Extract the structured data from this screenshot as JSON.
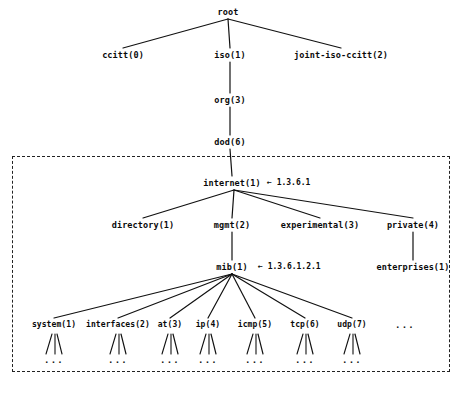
{
  "diagram": {
    "type": "tree",
    "width": 467,
    "height": 393,
    "line_color": "#111111",
    "text_color": "#0a0a0a",
    "background": "#ffffff"
  },
  "nodes": {
    "root": {
      "label": "root",
      "x": 228,
      "y": 12
    },
    "ccitt": {
      "label": "ccitt(0)",
      "x": 123,
      "y": 55
    },
    "iso": {
      "label": "iso(1)",
      "x": 230,
      "y": 55
    },
    "joint": {
      "label": "joint-iso-ccitt(2)",
      "x": 341,
      "y": 55
    },
    "org": {
      "label": "org(3)",
      "x": 230,
      "y": 100
    },
    "dod": {
      "label": "dod(6)",
      "x": 230,
      "y": 142
    },
    "internet": {
      "label": "internet(1)",
      "x": 232,
      "y": 183
    },
    "directory": {
      "label": "directory(1)",
      "x": 143,
      "y": 225
    },
    "mgmt": {
      "label": "mgmt(2)",
      "x": 232,
      "y": 225
    },
    "experimental": {
      "label": "experimental(3)",
      "x": 320,
      "y": 225
    },
    "private": {
      "label": "private(4)",
      "x": 413,
      "y": 225
    },
    "mib": {
      "label": "mib(1)",
      "x": 232,
      "y": 267
    },
    "enterprises": {
      "label": "enterprises(1)",
      "x": 413,
      "y": 267
    }
  },
  "annotations": [
    {
      "name": "internet-oid",
      "text": "← 1.3.6.1",
      "x": 267,
      "y": 183
    },
    {
      "name": "mib-oid",
      "text": "← 1.3.6.1.2.1",
      "x": 258,
      "y": 267
    }
  ],
  "mib_leaves": [
    {
      "label": "system(1)",
      "x": 54
    },
    {
      "label": "interfaces(2)",
      "x": 118
    },
    {
      "label": "at(3)",
      "x": 170
    },
    {
      "label": "ip(4)",
      "x": 208
    },
    {
      "label": "icmp(5)",
      "x": 255
    },
    {
      "label": "tcp(6)",
      "x": 305
    },
    {
      "label": "udp(7)",
      "x": 352
    }
  ],
  "mib_leaf_row_y": 325,
  "mib_more": {
    "label": "...",
    "x": 405,
    "y": 325
  },
  "leaf_children_ellipsis": "...",
  "dashed_box": {
    "x": 12,
    "y": 156,
    "width": 438,
    "height": 216
  }
}
